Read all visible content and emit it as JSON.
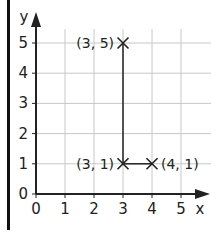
{
  "chart_data": {
    "type": "line",
    "title": "",
    "xlabel": "x",
    "ylabel": "y",
    "xlim": [
      0,
      5
    ],
    "ylim": [
      0,
      5
    ],
    "x_ticks": [
      "0",
      "1",
      "2",
      "3",
      "4",
      "5"
    ],
    "y_ticks": [
      "0",
      "1",
      "2",
      "3",
      "4",
      "5"
    ],
    "grid": true,
    "points": [
      {
        "x": 3,
        "y": 5,
        "label": "(3, 5)"
      },
      {
        "x": 3,
        "y": 1,
        "label": "(3, 1)"
      },
      {
        "x": 4,
        "y": 1,
        "label": "(4, 1)"
      }
    ],
    "segments": [
      {
        "from": [
          3,
          5
        ],
        "to": [
          3,
          1
        ]
      },
      {
        "from": [
          3,
          1
        ],
        "to": [
          4,
          1
        ]
      }
    ],
    "marker": "x"
  }
}
